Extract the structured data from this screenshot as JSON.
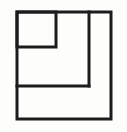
{
  "figure": {
    "canvas": {
      "width": 127,
      "height": 132,
      "background_color": "#fdfdfc"
    },
    "style": {
      "stroke_color": "#1c1c1c",
      "stroke_width": 3,
      "fill": "none"
    },
    "shapes": [
      {
        "name": "outer-square",
        "type": "rect",
        "x": 17,
        "y": 12,
        "width": 94,
        "height": 107
      },
      {
        "name": "inner-top-left-square",
        "type": "rect",
        "x": 17,
        "y": 12,
        "width": 39,
        "height": 35
      }
    ],
    "lines": [
      {
        "name": "vertical-divider",
        "type": "line",
        "x1": 89,
        "y1": 12,
        "x2": 89,
        "y2": 86
      },
      {
        "name": "horizontal-divider",
        "type": "line",
        "x1": 17,
        "y1": 86,
        "x2": 89,
        "y2": 86
      }
    ],
    "regions": [
      {
        "name": "region-top-left-small",
        "label": ""
      },
      {
        "name": "region-middle-large",
        "label": ""
      },
      {
        "name": "region-right-tall",
        "label": ""
      },
      {
        "name": "region-bottom-wide",
        "label": ""
      }
    ]
  }
}
